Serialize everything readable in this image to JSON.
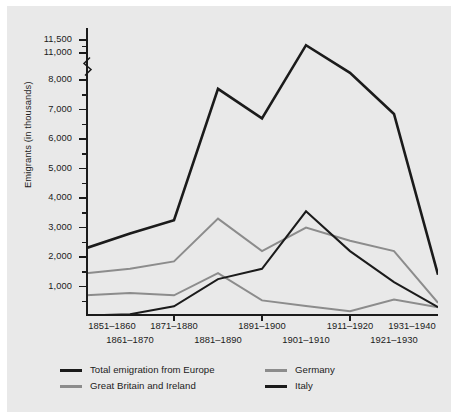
{
  "figure": {
    "background": "#e9e9e9",
    "page_background": "#ffffff"
  },
  "axes": {
    "y_title": "Emigrants (in thousands)",
    "y_tick_labels": [
      "1,000",
      "2,000",
      "3,000",
      "4,000",
      "5,000",
      "6,000",
      "7,000",
      "8,000",
      "11,000",
      "11,500"
    ],
    "y_axis_break": true,
    "x_tick_labels_row1": [
      "1851–1860",
      "1871–1880",
      "1891–1900",
      "1911–1920",
      "1931–1940"
    ],
    "x_tick_labels_row2": [
      "1861–1870",
      "1881–1890",
      "1901–1910",
      "1921–1930"
    ]
  },
  "legend": {
    "items": [
      {
        "label": "Total emigration from Europe",
        "color": "#1b1b1b",
        "weight": "thick"
      },
      {
        "label": "Great Britain and Ireland",
        "color": "#8c8c8c",
        "weight": "thick"
      },
      {
        "label": "Germany",
        "color": "#8c8c8c",
        "weight": "thin"
      },
      {
        "label": "Italy",
        "color": "#1b1b1b",
        "weight": "thin"
      }
    ]
  },
  "chart_data": {
    "type": "line",
    "title": "",
    "xlabel": "",
    "ylabel": "Emigrants (in thousands)",
    "categories": [
      "1851–1860",
      "1861–1870",
      "1871–1880",
      "1881–1890",
      "1891–1900",
      "1901–1910",
      "1911–1920",
      "1921–1930",
      "1931–1940"
    ],
    "ylim": [
      0,
      11500
    ],
    "y_axis_break": [
      8000,
      11000
    ],
    "y_ticks": [
      1000,
      2000,
      3000,
      4000,
      5000,
      6000,
      7000,
      8000,
      11000,
      11500
    ],
    "grid": false,
    "legend_position": "below",
    "series": [
      {
        "name": "Total emigration from Europe",
        "color": "#1b1b1b",
        "values": [
          2300,
          2800,
          3250,
          7700,
          6700,
          11300,
          8800,
          6850,
          1400
        ]
      },
      {
        "name": "Great Britain and Ireland",
        "color": "#8c8c8c",
        "values": [
          1450,
          1600,
          1850,
          3300,
          2200,
          3000,
          2550,
          2200,
          450
        ]
      },
      {
        "name": "Germany",
        "color": "#8c8c8c",
        "values": [
          700,
          780,
          700,
          1450,
          530,
          340,
          160,
          560,
          300
        ]
      },
      {
        "name": "Italy",
        "color": "#1b1b1b",
        "values": [
          20,
          60,
          330,
          1250,
          1600,
          3550,
          2200,
          1150,
          300
        ]
      }
    ]
  }
}
